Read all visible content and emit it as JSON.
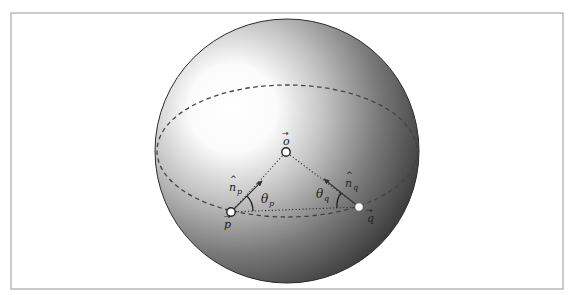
{
  "diagram": {
    "type": "sphere-geometry",
    "frame": {
      "x": 11,
      "y": 13,
      "width": 552,
      "height": 276,
      "stroke": "#a8a8a8"
    },
    "sphere": {
      "cx": 287,
      "cy": 151,
      "r": 132,
      "highlight": {
        "cx": 235,
        "cy": 110
      },
      "colors": {
        "highlight": "#ffffff",
        "mid": "#b5b5b5",
        "shadow": "#3c3c3c",
        "edge": "#2a2a2a"
      }
    },
    "equator": {
      "cx": 287,
      "cy": 151,
      "rx": 130,
      "ry": 66,
      "style": "dashed",
      "color": "#444444"
    },
    "points": {
      "o": {
        "x": 286,
        "y": 152,
        "label": "o",
        "label_x": 283,
        "label_y": 143
      },
      "p": {
        "x": 231,
        "y": 212,
        "label": "p",
        "label_x": 223,
        "label_y": 226
      },
      "q": {
        "x": 359,
        "y": 207,
        "label": "q",
        "label_x": 366,
        "label_y": 222
      }
    },
    "normals": {
      "n_p": {
        "from": [
          231,
          212
        ],
        "to": [
          262,
          181
        ],
        "label": "n",
        "sub": "p",
        "label_x": 229,
        "label_y": 190
      },
      "n_q": {
        "from": [
          359,
          207
        ],
        "to": [
          324,
          179
        ],
        "label": "n",
        "sub": "q",
        "label_x": 344,
        "label_y": 186
      }
    },
    "angles": {
      "theta_p": {
        "label": "θ",
        "sub": "p",
        "x": 255,
        "y": 204
      },
      "theta_q": {
        "label": "θ",
        "sub": "q",
        "x": 316,
        "y": 198
      }
    },
    "connections": [
      {
        "from": "p",
        "to": "o",
        "style": "dotted"
      },
      {
        "from": "q",
        "to": "o",
        "style": "dotted"
      },
      {
        "from": "p",
        "to": "q",
        "style": "dotted"
      }
    ]
  }
}
